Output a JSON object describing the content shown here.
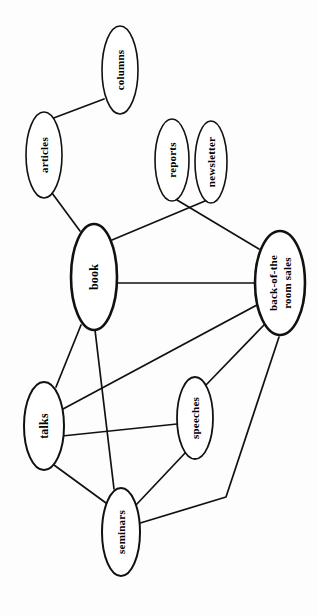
{
  "diagram": {
    "type": "node-link-graph",
    "title": "",
    "orientation_note": "rotated-90-ccw",
    "canvas": {
      "width": 318,
      "height": 615
    },
    "colors": {
      "background": "#fdfdfd",
      "node_fill": "#ffffff",
      "node_stroke": "#111111",
      "edge_stroke": "#111111",
      "label_color": "#000000"
    },
    "nodes": [
      {
        "id": "columns",
        "label": "columns",
        "lines": [
          "columns"
        ],
        "cx": 120,
        "cy": 70,
        "rx": 18,
        "ry": 44,
        "stroke_width": 1.6,
        "font_size": 11
      },
      {
        "id": "articles",
        "label": "articles",
        "lines": [
          "articles"
        ],
        "cx": 44,
        "cy": 155,
        "rx": 18,
        "ry": 43,
        "stroke_width": 1.6,
        "font_size": 11
      },
      {
        "id": "reports",
        "label": "reports",
        "lines": [
          "reports"
        ],
        "cx": 172,
        "cy": 160,
        "rx": 17,
        "ry": 41,
        "stroke_width": 1.6,
        "font_size": 11
      },
      {
        "id": "newsletter",
        "label": "newsletter",
        "lines": [
          "newsletter"
        ],
        "cx": 211,
        "cy": 162,
        "rx": 16,
        "ry": 41,
        "stroke_width": 1.6,
        "font_size": 11
      },
      {
        "id": "book",
        "label": "book",
        "lines": [
          "book"
        ],
        "cx": 94,
        "cy": 277,
        "rx": 23,
        "ry": 53,
        "stroke_width": 2.6,
        "font_size": 12
      },
      {
        "id": "back-of-the-room-sales",
        "label": "back-of-the room sales",
        "lines": [
          "back-of-the",
          "room sales"
        ],
        "cx": 280,
        "cy": 283,
        "rx": 25,
        "ry": 52,
        "stroke_width": 2.6,
        "font_size": 11
      },
      {
        "id": "talks",
        "label": "talks",
        "lines": [
          "talks"
        ],
        "cx": 44,
        "cy": 426,
        "rx": 20,
        "ry": 44,
        "stroke_width": 2.0,
        "font_size": 12
      },
      {
        "id": "speeches",
        "label": "speeches",
        "lines": [
          "speeches"
        ],
        "cx": 195,
        "cy": 418,
        "rx": 18,
        "ry": 41,
        "stroke_width": 1.8,
        "font_size": 11
      },
      {
        "id": "seminars",
        "label": "seminars",
        "lines": [
          "seminars"
        ],
        "cx": 121,
        "cy": 532,
        "rx": 19,
        "ry": 44,
        "stroke_width": 2.0,
        "font_size": 11
      }
    ],
    "edges": [
      {
        "id": "e1",
        "source": "articles",
        "target": "columns",
        "points": "51,119 104,99",
        "stroke_width": 1.7
      },
      {
        "id": "e2",
        "source": "articles",
        "target": "book",
        "points": "52,193 80,231",
        "stroke_width": 1.7
      },
      {
        "id": "e3",
        "source": "reports",
        "target": "back-of-the-room-sales",
        "points": "177,200 259,249",
        "stroke_width": 1.7
      },
      {
        "id": "e4",
        "source": "newsletter",
        "target": "book",
        "points": "205,201 112,240",
        "stroke_width": 1.7
      },
      {
        "id": "e5",
        "source": "book",
        "target": "back-of-the-room-sales",
        "points": "117,283 255,283",
        "stroke_width": 1.7
      },
      {
        "id": "e6",
        "source": "book",
        "target": "talks",
        "points": "81,325 56,387",
        "stroke_width": 1.7
      },
      {
        "id": "e7",
        "source": "book",
        "target": "seminars",
        "points": "95,330 114,489",
        "stroke_width": 1.7
      },
      {
        "id": "e8",
        "source": "talks",
        "target": "back-of-the-room-sales",
        "points": "63,409 257,305",
        "stroke_width": 1.7
      },
      {
        "id": "e9",
        "source": "talks",
        "target": "speeches",
        "points": "62,436 177,424",
        "stroke_width": 1.7
      },
      {
        "id": "e10",
        "source": "speeches",
        "target": "back-of-the-room-sales",
        "points": "206,385 264,325",
        "stroke_width": 1.7
      },
      {
        "id": "e11",
        "source": "talks",
        "target": "seminars",
        "points": "54,465 106,503",
        "stroke_width": 1.7
      },
      {
        "id": "e12",
        "source": "speeches",
        "target": "seminars",
        "points": "186,452 136,505",
        "stroke_width": 1.7
      },
      {
        "id": "e13",
        "source": "seminars",
        "target": "back-of-the-room-sales",
        "points": "137,524 226,497 279,337",
        "stroke_width": 1.7
      }
    ]
  }
}
